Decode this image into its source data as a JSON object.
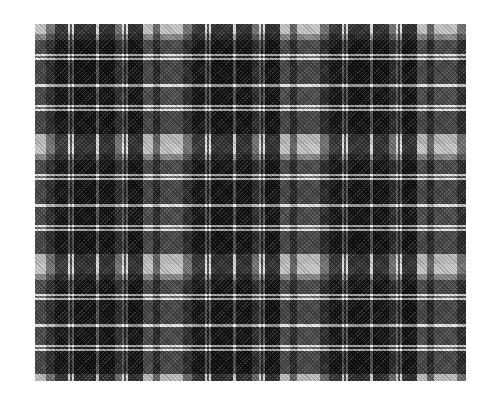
{
  "image": {
    "subject": "black, grey and white tartan plaid fabric swatch",
    "alt": "Grayscale tartan plaid pattern swatch",
    "palette": {
      "background": "#ffffff",
      "light_check": "#d2d2d2",
      "mid_grey": "#7a7a7a",
      "dark_ground": "#333333",
      "white_stripe": "#f0f0f0"
    }
  }
}
